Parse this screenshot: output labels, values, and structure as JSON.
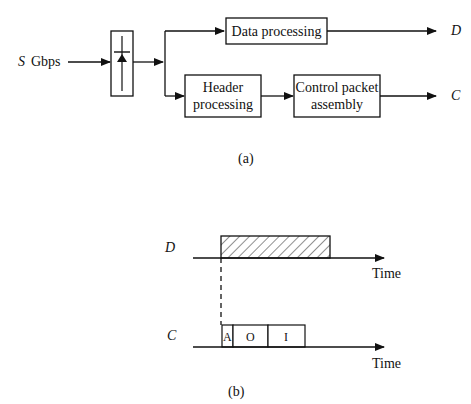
{
  "part_a": {
    "input_label_var": "S",
    "input_label_unit": "Gbps",
    "boxes": {
      "data": "Data processing",
      "header_line1": "Header",
      "header_line2": "processing",
      "control_line1": "Control packet",
      "control_line2": "assembly"
    },
    "outputs": {
      "data": "D",
      "control": "C"
    },
    "caption": "(a)"
  },
  "part_b": {
    "rows": [
      {
        "label": "D",
        "axis_label": "Time"
      },
      {
        "label": "C",
        "axis_label": "Time"
      }
    ],
    "control_fields": [
      "A",
      "O",
      "I"
    ],
    "caption": "(b)"
  }
}
